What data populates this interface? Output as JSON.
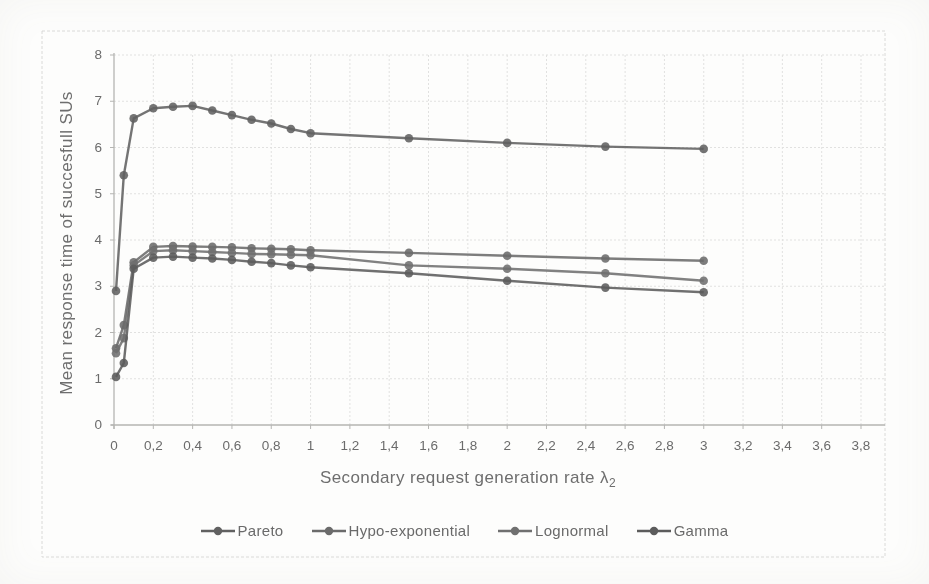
{
  "chart_data": {
    "type": "line",
    "title": "",
    "xlabel": "Secondary request generation rate λ",
    "xlabel_sub": "2",
    "ylabel": "Mean response time of succesfull SUs",
    "xlim": [
      0,
      3.8
    ],
    "ylim": [
      0,
      8
    ],
    "grid": true,
    "legend_position": "bottom",
    "decimal_separator": ",",
    "x_tick_labels": [
      "0",
      "0,2",
      "0,4",
      "0,6",
      "0,8",
      "1",
      "1,2",
      "1,4",
      "1,6",
      "1,8",
      "2",
      "2,2",
      "2,4",
      "2,6",
      "2,8",
      "3",
      "3,2",
      "3,4",
      "3,6",
      "3,8"
    ],
    "x_tick_values": [
      0,
      0.2,
      0.4,
      0.6,
      0.8,
      1,
      1.2,
      1.4,
      1.6,
      1.8,
      2,
      2.2,
      2.4,
      2.6,
      2.8,
      3,
      3.2,
      3.4,
      3.6,
      3.8
    ],
    "y_tick_labels": [
      "0",
      "1",
      "2",
      "3",
      "4",
      "5",
      "6",
      "7",
      "8"
    ],
    "y_tick_values": [
      0,
      1,
      2,
      3,
      4,
      5,
      6,
      7,
      8
    ],
    "x": [
      0.01,
      0.05,
      0.1,
      0.2,
      0.3,
      0.4,
      0.5,
      0.6,
      0.7,
      0.8,
      0.9,
      1,
      1.5,
      2,
      2.5,
      3
    ],
    "series": [
      {
        "name": "Pareto",
        "color": "#616161",
        "values": [
          2.9,
          5.4,
          6.63,
          6.85,
          6.88,
          6.9,
          6.8,
          6.7,
          6.6,
          6.52,
          6.4,
          6.31,
          6.2,
          6.1,
          6.02,
          5.97
        ]
      },
      {
        "name": "Hypo-exponential",
        "color": "#6b6b6b",
        "values": [
          1.66,
          2.16,
          3.52,
          3.85,
          3.87,
          3.86,
          3.85,
          3.84,
          3.82,
          3.81,
          3.8,
          3.78,
          3.72,
          3.66,
          3.6,
          3.55
        ]
      },
      {
        "name": "Lognormal",
        "color": "#707070",
        "values": [
          1.55,
          1.88,
          3.45,
          3.76,
          3.78,
          3.76,
          3.74,
          3.72,
          3.7,
          3.69,
          3.68,
          3.67,
          3.45,
          3.38,
          3.28,
          3.12
        ]
      },
      {
        "name": "Gamma",
        "color": "#5c5c5c",
        "values": [
          1.04,
          1.34,
          3.38,
          3.62,
          3.64,
          3.62,
          3.6,
          3.57,
          3.53,
          3.5,
          3.45,
          3.41,
          3.28,
          3.12,
          2.97,
          2.87
        ]
      }
    ],
    "styles": {
      "text_color": "#6b6b6b",
      "grid_color": "#e1e1e0",
      "axis_color": "#b5b5b2",
      "frame_color": "#dadad8"
    }
  }
}
